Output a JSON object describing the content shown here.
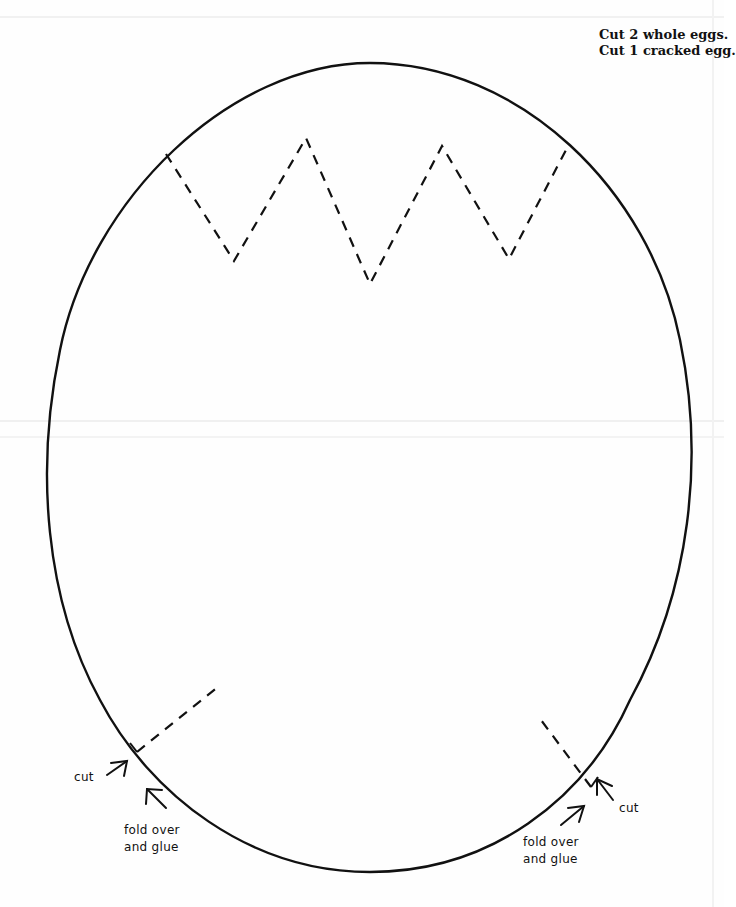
{
  "instructions": {
    "line1": "Cut 2 whole eggs.",
    "line2": "Cut 1 cracked egg."
  },
  "annotations": {
    "left_cut": "cut",
    "left_fold_line1": "fold over",
    "left_fold_line2": "and glue",
    "right_cut": "cut",
    "right_fold_line1": "fold over",
    "right_fold_line2": "and glue"
  },
  "colors": {
    "ink": "#111111",
    "paper": "#fefefe"
  },
  "icons": [
    "arrow-icon-left-cut",
    "arrow-icon-left-fold",
    "arrow-icon-right-cut",
    "arrow-icon-right-fold"
  ]
}
